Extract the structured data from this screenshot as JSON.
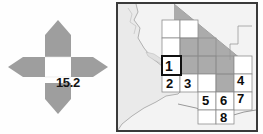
{
  "figure": {
    "panels": [
      "compass-diagram",
      "reference-map"
    ]
  },
  "compass": {
    "center_value": "15.2",
    "petal_color": "#9e9e9e",
    "center_color": "#ffffff",
    "petals": [
      {
        "name": "north-petal",
        "direction": "north"
      },
      {
        "name": "east-petal",
        "direction": "east"
      },
      {
        "name": "south-petal",
        "direction": "south"
      },
      {
        "name": "west-petal",
        "direction": "west"
      }
    ]
  },
  "map": {
    "frame_color": "#3a3a3a",
    "land_color": "#f2f2f2",
    "ocean_color": "#e6e6e6",
    "shaded_region_color": "#a8a8a8",
    "grid_line_color": "#8c8c8c",
    "cell_fill_color": "#ffffff",
    "highlight_border_color": "#101010",
    "cells": [
      {
        "label": "1",
        "highlighted": true,
        "x": 62,
        "y": 44
      },
      {
        "label": "2",
        "highlighted": false,
        "x": 62,
        "y": 62
      },
      {
        "label": "3",
        "highlighted": false,
        "x": 80,
        "y": 62
      },
      {
        "label": "4",
        "highlighted": false,
        "x": 114,
        "y": 62
      },
      {
        "label": "5",
        "highlighted": false,
        "x": 80,
        "y": 80
      },
      {
        "label": "6",
        "highlighted": false,
        "x": 98,
        "y": 80
      },
      {
        "label": "7",
        "highlighted": false,
        "x": 114,
        "y": 80
      },
      {
        "label": "8",
        "highlighted": false,
        "x": 98,
        "y": 98
      }
    ]
  }
}
